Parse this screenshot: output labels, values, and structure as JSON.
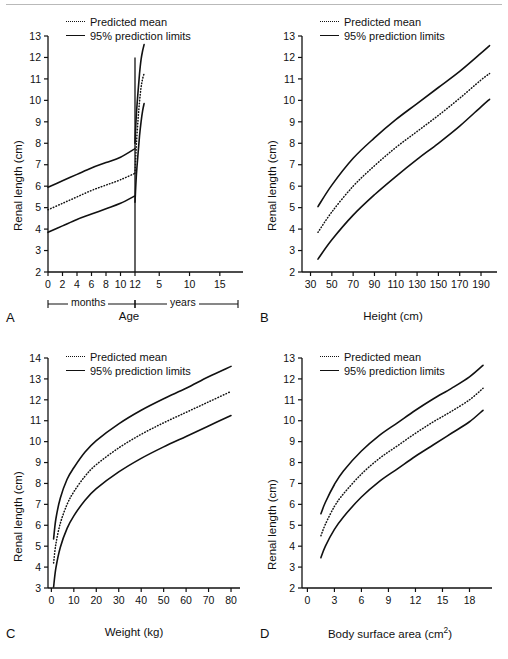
{
  "figure": {
    "legend": {
      "predicted_mean": "Predicted mean",
      "prediction_limits": "95% prediction limits",
      "mean_key_icon": "dotted-line-icon",
      "limits_key_icon": "solid-line-icon"
    },
    "shared_ylabel": "Renal length (cm)",
    "line_color": "#111111"
  },
  "chart_data": [
    {
      "panel": "A",
      "type": "line",
      "title": "",
      "xlabel": "Age",
      "ylabel": "Renal length (cm)",
      "xlim": [
        -0.6,
        19.5
      ],
      "ylim": [
        2,
        13
      ],
      "yticks": [
        2,
        3,
        4,
        5,
        6,
        7,
        8,
        9,
        10,
        11,
        12,
        13
      ],
      "xticks_months": [
        0,
        2,
        4,
        6,
        8,
        10,
        12
      ],
      "xticks_years": [
        5,
        10,
        15
      ],
      "axis_break_label_left": "months",
      "axis_break_label_right": "years",
      "grid": false,
      "legend_position": "top-left",
      "note": "Axis is piecewise: 0-12 months then 1-18 years; vertical divider drawn at 12 months",
      "series": [
        {
          "name": "95% upper prediction limit",
          "style": "solid",
          "x": [
            0,
            2,
            4,
            6,
            8,
            10,
            12,
            12,
            13,
            15,
            18,
            21,
            24,
            27,
            30
          ],
          "values": [
            5.95,
            6.25,
            6.55,
            6.85,
            7.1,
            7.35,
            7.75,
            8.0,
            8.55,
            9.45,
            10.4,
            11.25,
            11.9,
            12.3,
            12.6
          ]
        },
        {
          "name": "Predicted mean",
          "style": "dotted",
          "x": [
            0,
            2,
            4,
            6,
            8,
            10,
            12,
            12,
            13,
            15,
            18,
            21,
            24,
            27,
            30
          ],
          "values": [
            4.9,
            5.2,
            5.5,
            5.8,
            6.05,
            6.3,
            6.6,
            6.6,
            7.1,
            8.05,
            9.1,
            9.95,
            10.6,
            11.0,
            11.25
          ]
        },
        {
          "name": "95% lower prediction limit",
          "style": "solid",
          "x": [
            0,
            2,
            4,
            6,
            8,
            10,
            12,
            12,
            13,
            15,
            18,
            21,
            24,
            27,
            30
          ],
          "values": [
            3.85,
            4.15,
            4.45,
            4.7,
            4.95,
            5.2,
            5.55,
            5.25,
            5.75,
            6.6,
            7.5,
            8.35,
            9.0,
            9.5,
            9.85
          ]
        }
      ]
    },
    {
      "panel": "B",
      "type": "line",
      "title": "",
      "xlabel": "Height (cm)",
      "ylabel": "Renal length (cm)",
      "xlim": [
        22,
        205
      ],
      "ylim": [
        2,
        13
      ],
      "yticks": [
        2,
        3,
        4,
        5,
        6,
        7,
        8,
        9,
        10,
        11,
        12,
        13
      ],
      "xticks": [
        30,
        50,
        70,
        90,
        110,
        130,
        150,
        170,
        190
      ],
      "grid": false,
      "legend_position": "top-left",
      "x": [
        37,
        50,
        70,
        90,
        110,
        130,
        150,
        170,
        190,
        198
      ],
      "series": [
        {
          "name": "95% upper prediction limit",
          "style": "solid",
          "values": [
            5.05,
            6.05,
            7.3,
            8.25,
            9.1,
            9.85,
            10.6,
            11.35,
            12.2,
            12.55
          ]
        },
        {
          "name": "Predicted mean",
          "style": "dotted",
          "values": [
            3.85,
            4.8,
            6.0,
            6.95,
            7.8,
            8.55,
            9.3,
            10.1,
            10.95,
            11.25
          ]
        },
        {
          "name": "95% lower prediction limit",
          "style": "solid",
          "values": [
            2.6,
            3.5,
            4.65,
            5.6,
            6.45,
            7.25,
            8.0,
            8.8,
            9.7,
            10.05
          ]
        }
      ]
    },
    {
      "panel": "C",
      "type": "line",
      "title": "",
      "xlabel": "Weight (kg)",
      "ylabel": "Renal length (cm)",
      "xlim": [
        -1.5,
        84
      ],
      "ylim": [
        3,
        14
      ],
      "yticks": [
        3,
        4,
        5,
        6,
        7,
        8,
        9,
        10,
        11,
        12,
        13,
        14
      ],
      "xticks": [
        0,
        10,
        20,
        30,
        40,
        50,
        60,
        70,
        80
      ],
      "grid": false,
      "legend_position": "top-left",
      "x": [
        1,
        2,
        4,
        7,
        10,
        15,
        20,
        30,
        40,
        50,
        60,
        70,
        80
      ],
      "series": [
        {
          "name": "95% upper prediction limit",
          "style": "solid",
          "values": [
            5.35,
            6.3,
            7.3,
            8.2,
            8.75,
            9.5,
            10.05,
            10.85,
            11.5,
            12.05,
            12.55,
            13.1,
            13.6
          ]
        },
        {
          "name": "Predicted mean",
          "style": "dotted",
          "values": [
            4.2,
            5.1,
            6.1,
            7.0,
            7.6,
            8.35,
            8.9,
            9.7,
            10.35,
            10.9,
            11.4,
            11.9,
            12.4
          ]
        },
        {
          "name": "95% lower prediction limit",
          "style": "solid",
          "values": [
            3.05,
            3.95,
            4.95,
            5.85,
            6.45,
            7.2,
            7.75,
            8.55,
            9.2,
            9.75,
            10.25,
            10.75,
            11.25
          ]
        }
      ]
    },
    {
      "panel": "D",
      "type": "line",
      "title": "",
      "xlabel": "Body surface area (cm2)",
      "xlabel_base": "Body surface area (cm",
      "xlabel_sup": "2",
      "xlabel_tail": ")",
      "ylabel": "Renal length (cm)",
      "xlim": [
        -0.6,
        20.5
      ],
      "ylim": [
        2,
        13
      ],
      "yticks": [
        2,
        3,
        4,
        5,
        6,
        7,
        8,
        9,
        10,
        11,
        12,
        13
      ],
      "xticks": [
        0,
        3,
        6,
        9,
        12,
        15,
        18
      ],
      "grid": false,
      "legend_position": "top-left",
      "x": [
        1.5,
        2,
        3,
        4,
        6,
        8,
        10,
        12,
        14,
        16,
        18,
        19.5
      ],
      "series": [
        {
          "name": "95% upper prediction limit",
          "style": "solid",
          "values": [
            5.55,
            6.1,
            6.95,
            7.6,
            8.55,
            9.3,
            9.9,
            10.5,
            11.05,
            11.55,
            12.1,
            12.65
          ]
        },
        {
          "name": "Predicted mean",
          "style": "dotted",
          "values": [
            4.5,
            5.05,
            5.9,
            6.5,
            7.45,
            8.2,
            8.8,
            9.4,
            9.95,
            10.45,
            11.0,
            11.55
          ]
        },
        {
          "name": "95% lower prediction limit",
          "style": "solid",
          "values": [
            3.45,
            4.0,
            4.8,
            5.4,
            6.35,
            7.1,
            7.7,
            8.3,
            8.85,
            9.4,
            9.95,
            10.5
          ]
        }
      ]
    }
  ]
}
